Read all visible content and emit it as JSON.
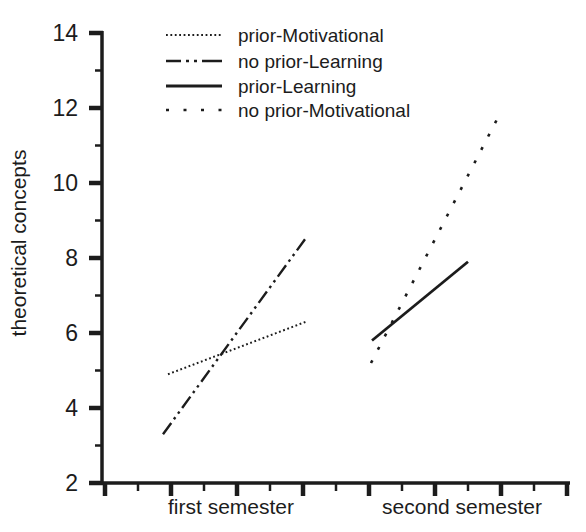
{
  "chart_data": {
    "type": "line",
    "title": "",
    "xlabel": "",
    "ylabel": "theoretical concepts",
    "ylim": [
      2,
      14
    ],
    "yticks": [
      2,
      4,
      6,
      8,
      10,
      12,
      14
    ],
    "yticks_minor": [
      3,
      5,
      7,
      9,
      11,
      13
    ],
    "x_categories": [
      "first semester",
      "second semester"
    ],
    "grid": false,
    "legend_position": "top-left-inside",
    "ink_color": "#1c1c1c",
    "background_color": "#ffffff",
    "series": [
      {
        "name": "prior-Motivational",
        "style": "dotted",
        "semester": "first",
        "x_px": [
          168,
          306
        ],
        "values": [
          4.9,
          6.3
        ]
      },
      {
        "name": "no prior-Learning",
        "style": "dash-dot-dot",
        "semester": "first",
        "x_px": [
          163,
          305
        ],
        "values": [
          3.3,
          8.5
        ]
      },
      {
        "name": "prior-Learning",
        "style": "solid",
        "semester": "second",
        "x_px": [
          372,
          468
        ],
        "values": [
          5.8,
          7.9
        ]
      },
      {
        "name": "no prior-Motivational",
        "style": "dashed",
        "semester": "second",
        "x_px": [
          371,
          499
        ],
        "values": [
          5.2,
          11.8
        ]
      }
    ]
  }
}
